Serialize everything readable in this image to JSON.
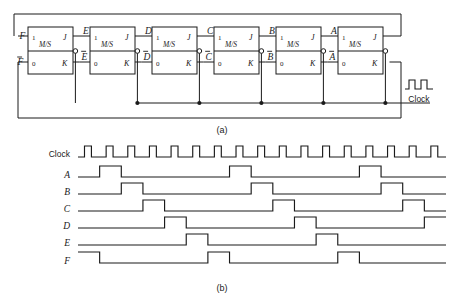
{
  "figure": {
    "caption_a": "(a)",
    "caption_b": "(b)",
    "clock_symbol_label": "Clock"
  },
  "circuit": {
    "type": "ring-counter",
    "stage_count": 6,
    "flipflop": {
      "kind": "M/S",
      "body_label": "M/S",
      "top_pin_left": "1",
      "top_pin_right": "J",
      "bottom_pin_left": "0",
      "bottom_pin_right": "K"
    },
    "stages": [
      {
        "q": "F",
        "qbar": "F",
        "qbar_overline": true
      },
      {
        "q": "E",
        "qbar": "E",
        "qbar_overline": true
      },
      {
        "q": "D",
        "qbar": "D",
        "qbar_overline": true
      },
      {
        "q": "C",
        "qbar": "C",
        "qbar_overline": true
      },
      {
        "q": "B",
        "qbar": "B",
        "qbar_overline": true
      },
      {
        "q": "A",
        "qbar": "A",
        "qbar_overline": true
      }
    ],
    "clock_bus_junction_count": 5
  },
  "timing": {
    "rows": [
      "Clock",
      "A",
      "B",
      "C",
      "D",
      "E",
      "F"
    ],
    "clock_cycles": 17,
    "period_clocks": 6,
    "waveforms": {
      "Clock": {
        "kind": "square",
        "cycles": 17
      },
      "A": {
        "kind": "pulse",
        "high_starts": [
          1,
          7,
          13
        ],
        "high_width": 1,
        "start_high": false
      },
      "B": {
        "kind": "pulse",
        "high_starts": [
          2,
          8,
          14
        ],
        "high_width": 1,
        "start_high": false
      },
      "C": {
        "kind": "pulse",
        "high_starts": [
          3,
          9,
          15
        ],
        "high_width": 1,
        "start_high": false
      },
      "D": {
        "kind": "pulse",
        "high_starts": [
          4,
          10,
          16
        ],
        "high_width": 1,
        "start_high": false
      },
      "E": {
        "kind": "pulse",
        "high_starts": [
          5,
          11
        ],
        "high_width": 1,
        "start_high": false
      },
      "F": {
        "kind": "pulse",
        "high_starts": [
          0,
          6,
          12
        ],
        "high_width": 1,
        "start_high": true
      }
    }
  },
  "colors": {
    "ink": "#1a1a1a",
    "paper": "#ffffff"
  }
}
